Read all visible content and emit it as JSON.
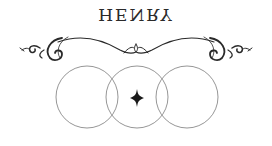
{
  "title": "HENRY",
  "colors": {
    "ink": "#2a2a2a",
    "circle_stroke": "#8a8a8a",
    "background": "#ffffff"
  },
  "ornament": {
    "icon": "flourish-divider-icon"
  },
  "circles": [
    {
      "cx": 87,
      "cy": 97,
      "r": 31
    },
    {
      "cx": 137,
      "cy": 97,
      "r": 31
    },
    {
      "cx": 187,
      "cy": 97,
      "r": 31
    }
  ],
  "star": {
    "icon": "four-point-star-icon",
    "cx": 137,
    "cy": 98
  }
}
